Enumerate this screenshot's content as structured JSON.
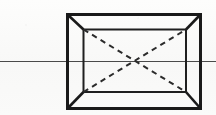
{
  "figure": {
    "caption": "Rectangular box drawn in one-point perspective with horizon line and dashed diagonals",
    "background_color": "#fbfbfa",
    "canvas": {
      "width": 216,
      "height": 115
    }
  },
  "chart_data": {
    "type": "diagram",
    "subtitle": "",
    "xlabel": "",
    "ylabel": "",
    "grid": false,
    "legend": null,
    "annotations": [],
    "geometry": {
      "units": "px",
      "coordinate_origin": "top-left",
      "vanishing_point": {
        "x": 134,
        "y": 61
      },
      "horizon_line": {
        "name": "horizon-line",
        "y": 61,
        "x_start": 0,
        "x_end": 216,
        "stroke": "#4a4a4a",
        "stroke_width": 1,
        "style": "solid"
      },
      "outer_rectangle": {
        "name": "outer-frame",
        "left": 67.5,
        "top": 14.5,
        "right": 200.5,
        "bottom": 108.5,
        "stroke": "#1a1a1a",
        "stroke_width": 3,
        "style": "solid",
        "corners": [
          {
            "label": "outer-top-left",
            "x": 67.5,
            "y": 14.5
          },
          {
            "label": "outer-top-right",
            "x": 200.5,
            "y": 14.5
          },
          {
            "label": "outer-bottom-right",
            "x": 200.5,
            "y": 108.5
          },
          {
            "label": "outer-bottom-left",
            "x": 67.5,
            "y": 108.5
          }
        ]
      },
      "inner_rectangle": {
        "name": "back-wall",
        "left": 83.5,
        "top": 29.5,
        "right": 186.0,
        "bottom": 92.0,
        "stroke": "#1f1f1f",
        "stroke_width": 2,
        "style": "solid",
        "corners": [
          {
            "label": "inner-top-left",
            "x": 83.5,
            "y": 29.5
          },
          {
            "label": "inner-top-right",
            "x": 186.0,
            "y": 29.5
          },
          {
            "label": "inner-bottom-right",
            "x": 186.0,
            "y": 92.0
          },
          {
            "label": "inner-bottom-left",
            "x": 83.5,
            "y": 92.0
          }
        ]
      },
      "receding_edges": [
        {
          "label": "edge-top-left",
          "x1": 67.5,
          "y1": 14.5,
          "x2": 83.5,
          "y2": 29.5,
          "stroke": "#1a1a1a",
          "stroke_width": 2.6,
          "style": "solid"
        },
        {
          "label": "edge-top-right",
          "x1": 200.5,
          "y1": 14.5,
          "x2": 186.0,
          "y2": 29.5,
          "stroke": "#1a1a1a",
          "stroke_width": 2.6,
          "style": "solid"
        },
        {
          "label": "edge-bottom-right",
          "x1": 200.5,
          "y1": 108.5,
          "x2": 186.0,
          "y2": 92.0,
          "stroke": "#1a1a1a",
          "stroke_width": 2.6,
          "style": "solid"
        },
        {
          "label": "edge-bottom-left",
          "x1": 67.5,
          "y1": 108.5,
          "x2": 83.5,
          "y2": 92.0,
          "stroke": "#1a1a1a",
          "stroke_width": 2.6,
          "style": "solid"
        }
      ],
      "diagonals": [
        {
          "label": "diagonal-tl-br",
          "x1": 83.5,
          "y1": 29.5,
          "x2": 186.0,
          "y2": 92.0,
          "stroke": "#2b2b2b",
          "stroke_width": 2,
          "style": "dashed",
          "dash_length": 5.5,
          "dash_gap": 4.5
        },
        {
          "label": "diagonal-bl-tr",
          "x1": 83.5,
          "y1": 92.0,
          "x2": 186.0,
          "y2": 29.5,
          "stroke": "#2b2b2b",
          "stroke_width": 2,
          "style": "dashed",
          "dash_length": 5.5,
          "dash_gap": 4.5
        }
      ]
    }
  }
}
